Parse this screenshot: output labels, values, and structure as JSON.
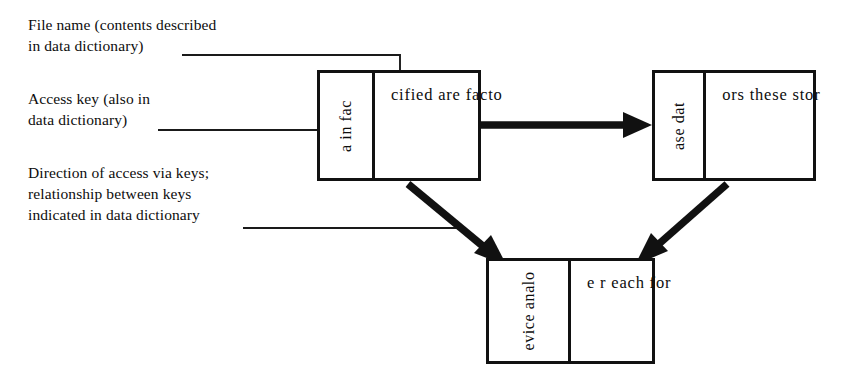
{
  "diagram": {
    "type": "data-store-access-diagram",
    "annotations": [
      {
        "id": "file-name",
        "text": "File name (contents described\nin data dictionary)",
        "leader": "horizontal line running right then turning down into the first store box name area"
      },
      {
        "id": "access-key",
        "text": "Access key (also in\ndata dictionary)",
        "leader": "horizontal line running right into the left key column of the first store box"
      },
      {
        "id": "direction-of-access",
        "text": "Direction of access via keys;\nrelationship between keys\nindicated in data dictionary",
        "leader": "horizontal line running right to the diagonal access arrow"
      }
    ],
    "stores": [
      {
        "id": "store-1",
        "key_label": "a in fac",
        "name_label": "cified are facto"
      },
      {
        "id": "store-2",
        "key_label": "ase dat",
        "name_label": "ors these stor"
      },
      {
        "id": "store-3",
        "key_label": "evice analo",
        "name_label": "e r each for"
      }
    ],
    "arrows": [
      {
        "id": "arrow-1-to-2",
        "from": "store-1",
        "to": "store-2",
        "direction": "right"
      },
      {
        "id": "arrow-1-to-3",
        "from": "store-1",
        "to": "store-3",
        "direction": "down-right"
      },
      {
        "id": "arrow-2-to-3",
        "from": "store-2",
        "to": "store-3",
        "direction": "down-left"
      }
    ],
    "colors": {
      "ink": "#111111",
      "background": "#ffffff",
      "leader_line": "#1a1a1a"
    }
  }
}
